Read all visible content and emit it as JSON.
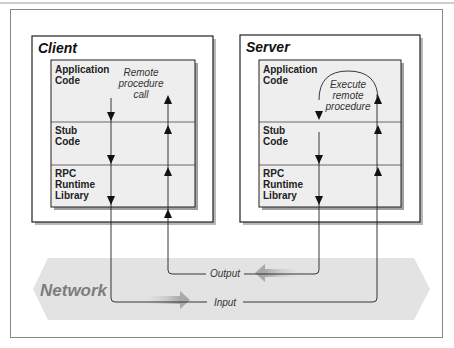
{
  "client": {
    "title": "Client",
    "layers": [
      {
        "line1": "Application",
        "line2": "Code",
        "line3": ""
      },
      {
        "line1": "Stub",
        "line2": "Code",
        "line3": ""
      },
      {
        "line1": "RPC",
        "line2": "Runtime",
        "line3": "Library"
      }
    ],
    "note": [
      "Remote",
      "procedure",
      "call"
    ]
  },
  "server": {
    "title": "Server",
    "layers": [
      {
        "line1": "Application",
        "line2": "Code",
        "line3": ""
      },
      {
        "line1": "Stub",
        "line2": "Code",
        "line3": ""
      },
      {
        "line1": "RPC",
        "line2": "Runtime",
        "line3": "Library"
      }
    ],
    "note": [
      "Execute",
      "remote",
      "procedure"
    ]
  },
  "network": {
    "label": "Network",
    "output_label": "Output",
    "input_label": "Input"
  },
  "colors": {
    "frame": "#555555",
    "inner_fill": "#eeeeee",
    "network_band": "#e4e4e4",
    "flow_arrow": "#bdbdbd",
    "line": "#222222"
  }
}
